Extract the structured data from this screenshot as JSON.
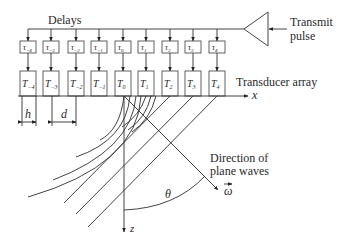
{
  "labels": {
    "delays": "Delays",
    "transmit_line1": "Transmit",
    "transmit_line2": "pulse",
    "transducer_array": "Transducer array",
    "x_axis": "x",
    "z_axis": "z",
    "direction_line1": "Direction of",
    "direction_line2": "plane waves",
    "omega": "ω",
    "theta": "θ",
    "h": "h",
    "d": "d"
  },
  "delays": [
    {
      "sym": "τ",
      "sub": "−4"
    },
    {
      "sym": "τ",
      "sub": "−3"
    },
    {
      "sym": "τ",
      "sub": "−2"
    },
    {
      "sym": "τ",
      "sub": "−1"
    },
    {
      "sym": "τ",
      "sub": "0"
    },
    {
      "sym": "τ",
      "sub": "1"
    },
    {
      "sym": "τ",
      "sub": "2"
    },
    {
      "sym": "τ",
      "sub": "3"
    },
    {
      "sym": "τ",
      "sub": "4"
    }
  ],
  "transducers": [
    {
      "sym": "T",
      "sub": "−4"
    },
    {
      "sym": "T",
      "sub": "−3"
    },
    {
      "sym": "T",
      "sub": "−2"
    },
    {
      "sym": "T",
      "sub": "−1"
    },
    {
      "sym": "T",
      "sub": "0"
    },
    {
      "sym": "T",
      "sub": "1"
    },
    {
      "sym": "T",
      "sub": "2"
    },
    {
      "sym": "T",
      "sub": "3"
    },
    {
      "sym": "T",
      "sub": "4"
    }
  ]
}
